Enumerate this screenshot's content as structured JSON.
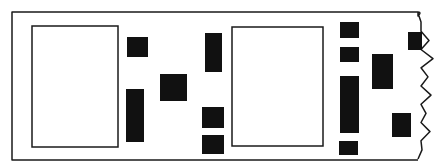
{
  "diagram": {
    "title": "",
    "colors": {
      "background": "#ffffff",
      "stroke": "#1a1a1a",
      "fill": "#111111"
    },
    "strip": {
      "left": 12,
      "top": 12,
      "bottom": 160,
      "right_top": 418,
      "edge": "torn-wavy"
    },
    "frames": [
      {
        "id": "frame-1",
        "x": 32,
        "y": 26,
        "w": 86,
        "h": 121
      },
      {
        "id": "frame-2",
        "x": 232,
        "y": 27,
        "w": 91,
        "h": 119
      }
    ],
    "blocks": [
      {
        "id": "block-1",
        "x": 127,
        "y": 37,
        "w": 21,
        "h": 20
      },
      {
        "id": "block-2",
        "x": 126,
        "y": 89,
        "w": 18,
        "h": 53
      },
      {
        "id": "block-3",
        "x": 160,
        "y": 74,
        "w": 27,
        "h": 27
      },
      {
        "id": "block-4",
        "x": 205,
        "y": 33,
        "w": 17,
        "h": 39
      },
      {
        "id": "block-5",
        "x": 202,
        "y": 107,
        "w": 22,
        "h": 21
      },
      {
        "id": "block-6",
        "x": 202,
        "y": 135,
        "w": 22,
        "h": 19
      },
      {
        "id": "block-7",
        "x": 340,
        "y": 22,
        "w": 19,
        "h": 16
      },
      {
        "id": "block-8",
        "x": 340,
        "y": 47,
        "w": 19,
        "h": 15
      },
      {
        "id": "block-9",
        "x": 340,
        "y": 76,
        "w": 19,
        "h": 57
      },
      {
        "id": "block-10",
        "x": 339,
        "y": 141,
        "w": 19,
        "h": 14
      },
      {
        "id": "block-11",
        "x": 372,
        "y": 54,
        "w": 21,
        "h": 35
      },
      {
        "id": "block-12",
        "x": 392,
        "y": 113,
        "w": 19,
        "h": 24
      },
      {
        "id": "block-13",
        "x": 408,
        "y": 32,
        "w": 14,
        "h": 18
      }
    ]
  }
}
